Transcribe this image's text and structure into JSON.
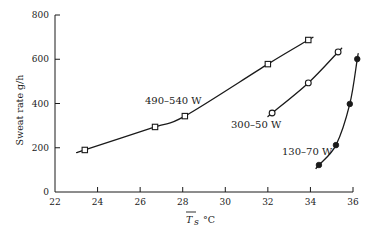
{
  "chart_data": {
    "type": "line",
    "title": "",
    "xlabel": "T̄s °C",
    "ylabel": "Sweat rate g/h",
    "xlim": [
      22,
      36
    ],
    "ylim": [
      0,
      800
    ],
    "x_ticks": [
      22,
      24,
      26,
      28,
      30,
      32,
      34,
      36
    ],
    "y_ticks": [
      0,
      200,
      400,
      600,
      800
    ],
    "grid": false,
    "legend": "inline labels",
    "series": [
      {
        "name": "490–540 W",
        "marker": "open-square",
        "x": [
          23.4,
          26.7,
          28.1,
          32.0,
          33.9
        ],
        "y": [
          190,
          294,
          343,
          578,
          687
        ]
      },
      {
        "name": "300–50 W",
        "marker": "open-circle",
        "x": [
          32.2,
          33.9,
          35.3
        ],
        "y": [
          357,
          493,
          633
        ]
      },
      {
        "name": "130–70 W",
        "marker": "filled-circle",
        "x": [
          34.4,
          35.2,
          35.85,
          36.2
        ],
        "y": [
          122,
          212,
          398,
          601
        ]
      }
    ]
  },
  "labels": {
    "series_1": "490–540 W",
    "series_2": "300–50 W",
    "series_3": "130–70 W",
    "ylabel": "Sweat rate g/h",
    "xlabel_symbol": "T",
    "xlabel_sub": "s",
    "xlabel_unit": "°C"
  }
}
